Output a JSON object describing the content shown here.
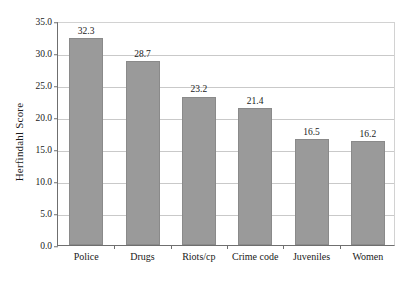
{
  "chart_data": {
    "type": "bar",
    "title": "",
    "subtitle": "",
    "xlabel": "",
    "ylabel": "Herfindahl Score",
    "categories": [
      "Police",
      "Drugs",
      "Riots/cp",
      "Crime code",
      "Juveniles",
      "Women"
    ],
    "values": [
      32.3,
      28.7,
      23.2,
      21.4,
      16.5,
      16.2
    ],
    "value_labels": [
      "32.3",
      "28.7",
      "23.2",
      "21.4",
      "16.5",
      "16.2"
    ],
    "ylim": [
      0.0,
      35.0
    ],
    "y_ticks": [
      0.0,
      5.0,
      10.0,
      15.0,
      20.0,
      25.0,
      30.0,
      35.0
    ],
    "y_tick_labels": [
      "0.0",
      "5.0",
      "10.0",
      "15.0",
      "20.0",
      "25.0",
      "30.0",
      "35.0"
    ],
    "grid": true,
    "grid_axis": "y",
    "legend": false,
    "legend_position": "none",
    "bar_color": "#9a9a9a",
    "bar_edge_color": "#8a8a8a",
    "axis_color": "#6f6f6f",
    "grid_color": "#c9c9c9",
    "background_color": "#ffffff"
  }
}
